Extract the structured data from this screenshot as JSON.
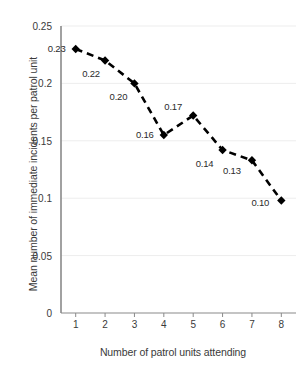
{
  "chart_data": {
    "type": "line",
    "title": "",
    "xlabel": "Number of patrol units attending",
    "ylabel": "Mean number of immediate incidents per patrol unit",
    "x": [
      1,
      2,
      3,
      4,
      5,
      6,
      7,
      8
    ],
    "values": [
      0.23,
      0.22,
      0.2,
      0.155,
      0.172,
      0.142,
      0.133,
      0.098
    ],
    "point_labels": [
      "0.23",
      "0.22",
      "0.20",
      "0.16",
      "0.17",
      "0.14",
      "0.13",
      "0.10"
    ],
    "xtick_labels": [
      "1",
      "2",
      "3",
      "4",
      "5",
      "6",
      "7",
      "8"
    ],
    "ytick_labels": [
      "0",
      "0.05",
      "0.1",
      "0.15",
      "0.2",
      "0.25"
    ],
    "ytick_values": [
      0,
      0.05,
      0.1,
      0.15,
      0.2,
      0.25
    ],
    "ylim": [
      0,
      0.25
    ],
    "xlim": [
      0.5,
      8.5
    ],
    "grid": "horizontal",
    "legend": "none",
    "series_name": "Mean immediate incidents per patrol unit",
    "line_style": "dashed",
    "marker": "diamond",
    "colors": {
      "line": "#000000",
      "marker": "#000000",
      "axis": "#808080",
      "grid": "#ededed",
      "text": "#3a3a3a",
      "background": "#ffffff"
    }
  }
}
